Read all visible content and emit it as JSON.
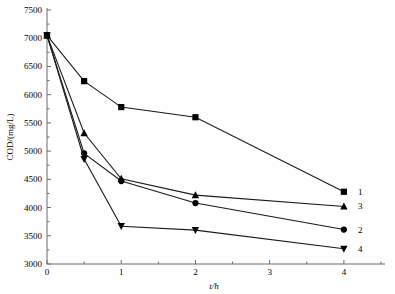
{
  "chart_data": {
    "type": "line",
    "title": "",
    "xlabel": "t/h",
    "ylabel": "COD/(mg/L)",
    "x": [
      0,
      0.5,
      1,
      2,
      4
    ],
    "xlim": [
      0,
      4.5
    ],
    "ylim": [
      3000,
      7500
    ],
    "xticks": [
      "0",
      "1",
      "2",
      "3",
      "4"
    ],
    "xtick_values": [
      0,
      1,
      2,
      3,
      4
    ],
    "yticks": [
      "3000",
      "3500",
      "4000",
      "4500",
      "5000",
      "5500",
      "6000",
      "6500",
      "7000",
      "7500"
    ],
    "ytick_values": [
      3000,
      3500,
      4000,
      4500,
      5000,
      5500,
      6000,
      6500,
      7000,
      7500
    ],
    "grid": false,
    "legend_position": "right-of-plot-at-line-ends",
    "series": [
      {
        "name": "1",
        "marker": "square",
        "values": [
          7050,
          6240,
          5780,
          5600,
          4280
        ]
      },
      {
        "name": "3",
        "marker": "triangle-up",
        "values": [
          7050,
          5320,
          4510,
          4220,
          4020
        ]
      },
      {
        "name": "2",
        "marker": "circle",
        "values": [
          7050,
          4960,
          4470,
          4080,
          3610
        ]
      },
      {
        "name": "4",
        "marker": "triangle-down",
        "values": [
          7050,
          4860,
          3670,
          3600,
          3270
        ]
      }
    ],
    "line_color": "#1a1a1a",
    "marker_color": "#000000",
    "axis_color": "#6b6b6b"
  }
}
